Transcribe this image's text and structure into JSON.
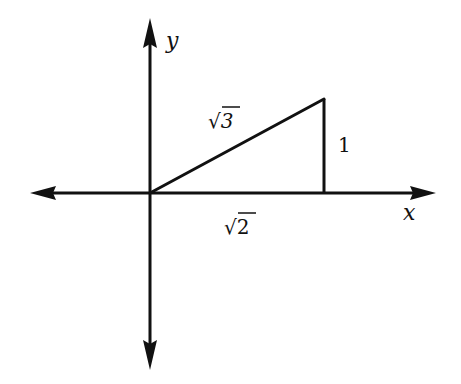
{
  "diagram": {
    "type": "right-triangle-on-axes",
    "colors": {
      "stroke": "#111111",
      "background": "#ffffff"
    },
    "axes": {
      "x_label": "x",
      "y_label": "y",
      "origin": [
        150,
        193
      ],
      "x_extent": [
        30,
        436
      ],
      "y_extent": [
        18,
        370
      ]
    },
    "triangle": {
      "vertices": [
        [
          150,
          193
        ],
        [
          324,
          193
        ],
        [
          324,
          99
        ]
      ],
      "hypotenuse_label": "√3",
      "vertical_leg_label": "1",
      "horizontal_leg_label": "√2"
    }
  }
}
